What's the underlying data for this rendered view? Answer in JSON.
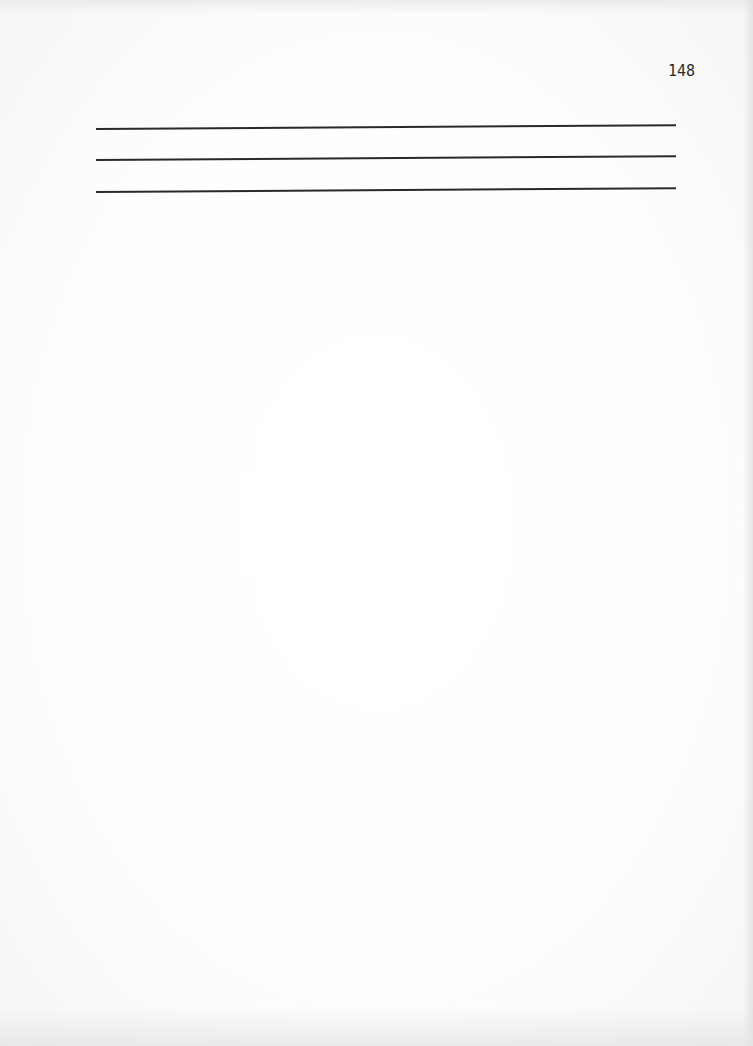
{
  "page": {
    "number": "148",
    "background_color": "#fdfdfd",
    "rule_color": "#2a2a2a",
    "rules": [
      {
        "id": "rule-1",
        "y": 128
      },
      {
        "id": "rule-2",
        "y": 159
      },
      {
        "id": "rule-3",
        "y": 191
      }
    ]
  }
}
